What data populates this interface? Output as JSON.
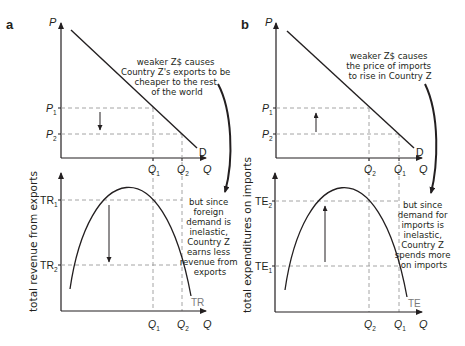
{
  "panels": {
    "a": {
      "label": "a",
      "top": {
        "y_axis": "P",
        "x_axis": "Q",
        "curve_label": "D",
        "p1": "P",
        "p1_sub": "1",
        "p2": "P",
        "p2_sub": "2",
        "q1": "Q",
        "q1_sub": "1",
        "q2": "Q",
        "q2_sub": "2",
        "note": [
          "weaker Z$ causes",
          "Country Z's exports to be",
          "cheaper to the rest",
          "of the world"
        ]
      },
      "bottom": {
        "y_axis_title": "total revenue from exports",
        "x_axis": "Q",
        "curve_label": "TR",
        "tr1": "TR",
        "tr1_sub": "1",
        "tr2": "TR",
        "tr2_sub": "2",
        "q1": "Q",
        "q1_sub": "1",
        "q2": "Q",
        "q2_sub": "2",
        "note": [
          "but since",
          "foreign",
          "demand is",
          "inelastic,",
          "Country Z",
          "earns less",
          "revenue from",
          "exports"
        ]
      }
    },
    "b": {
      "label": "b",
      "top": {
        "y_axis": "P",
        "x_axis": "Q",
        "curve_label": "D",
        "p1": "P",
        "p1_sub": "1",
        "p2": "P",
        "p2_sub": "2",
        "q2": "Q",
        "q2_sub": "2",
        "q1": "Q",
        "q1_sub": "1",
        "note": [
          "weaker Z$ causes",
          "the price of imports",
          "to rise in Country Z"
        ]
      },
      "bottom": {
        "y_axis_title": "total expenditures on imports",
        "x_axis": "Q",
        "curve_label": "TE",
        "te2": "TE",
        "te2_sub": "2",
        "te1": "TE",
        "te1_sub": "1",
        "q2": "Q",
        "q2_sub": "2",
        "q1": "Q",
        "q1_sub": "1",
        "note": [
          "but since",
          "demand for",
          "imports is",
          "inelastic,",
          "Country Z",
          "spends more",
          "on imports"
        ]
      }
    }
  },
  "colors": {
    "ink": "#231f20",
    "dash": "#9a9a9a",
    "curve_label": "#7a7a7a"
  }
}
